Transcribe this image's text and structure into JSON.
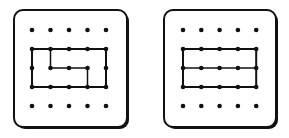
{
  "figure": {
    "colors": {
      "ink": "#111111",
      "background": "#ffffff"
    },
    "boards": [
      {
        "name": "left-geoboard",
        "grid": {
          "cols": 5,
          "rows": 5
        },
        "outline": [
          [
            0,
            1
          ],
          [
            4,
            1
          ],
          [
            4,
            3
          ],
          [
            0,
            3
          ]
        ],
        "inner_path": [
          [
            1,
            1
          ],
          [
            1,
            2
          ],
          [
            3,
            2
          ],
          [
            3,
            3
          ]
        ]
      },
      {
        "name": "right-geoboard",
        "grid": {
          "cols": 5,
          "rows": 5
        },
        "outline": [
          [
            0,
            1
          ],
          [
            4,
            1
          ],
          [
            4,
            3
          ],
          [
            0,
            3
          ]
        ],
        "inner_path": [
          [
            0,
            2
          ],
          [
            4,
            2
          ]
        ]
      }
    ]
  }
}
